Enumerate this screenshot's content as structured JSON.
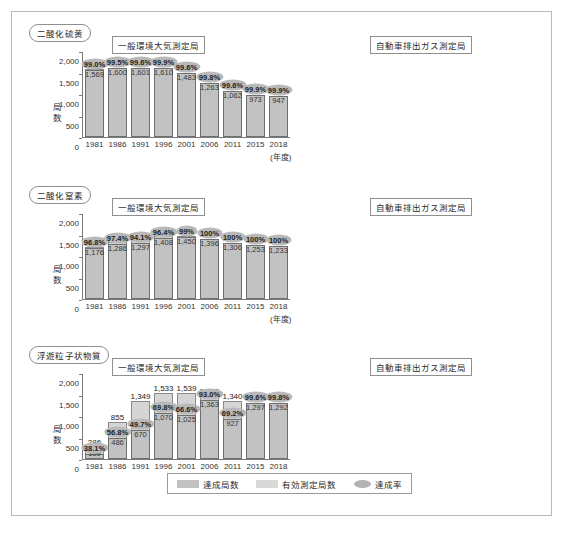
{
  "legend": {
    "achieved_label": "達成局数",
    "valid_label": "有効測定局数",
    "rate_label": "達成率"
  },
  "axis": {
    "ylabel": "局数",
    "nendo": "(年度)",
    "years": [
      "1981",
      "1986",
      "1991",
      "1996",
      "2001",
      "2006",
      "2011",
      "2015",
      "2018"
    ],
    "ticks_2000": [
      "2,000",
      "1,500",
      "1,000",
      "500",
      "0"
    ],
    "ticks_450": [
      "450",
      "300",
      "150",
      "0"
    ]
  },
  "panels": {
    "general": "一般環境大気測定局",
    "automobile": "自動車排出ガス測定局"
  },
  "pollutants": {
    "so2": "二酸化硫黄",
    "no2": "二酸化窒素",
    "spm": "浮遊粒子状物質"
  },
  "chart_data": [
    {
      "type": "bar",
      "title": "二酸化硫黄 — 一般環境大気測定局",
      "xlabel": "(年度)",
      "ylabel": "局数",
      "ylim": [
        0,
        2000
      ],
      "grid": false,
      "legend": "bottom",
      "categories": [
        "1981",
        "1986",
        "1991",
        "1996",
        "2001",
        "2006",
        "2011",
        "2015",
        "2018"
      ],
      "series": [
        {
          "name": "有効測定局数",
          "values": [
            1585,
            1608,
            1607,
            1612,
            1489,
            1265,
            1066,
            974,
            948
          ]
        },
        {
          "name": "達成局数",
          "values": [
            1569,
            1600,
            1601,
            1610,
            1483,
            1263,
            1062,
            973,
            947
          ]
        }
      ],
      "rates": [
        "99.0%",
        "99.5%",
        "99.6%",
        "99.9%",
        "99.6%",
        "99.8%",
        "99.6%",
        "99.9%",
        "99.9%"
      ]
    },
    {
      "type": "bar",
      "title": "二酸化硫黄 — 自動車排出ガス測定局",
      "xlabel": "(年度)",
      "ylabel": "局数",
      "ylim": [
        0,
        450
      ],
      "grid": false,
      "legend": "bottom",
      "categories": [
        "1981",
        "1986",
        "1991",
        "1996",
        "2001",
        "2006",
        "2011",
        "2015",
        "2018"
      ],
      "series": [
        {
          "name": "有効測定局数",
          "values": [
            42,
            49,
            70,
            101,
            95,
            86,
            61,
            51,
            49
          ]
        },
        {
          "name": "達成局数",
          "values": [
            40,
            48,
            69,
            101,
            95,
            86,
            61,
            51,
            49
          ]
        }
      ],
      "rates": [
        "95.2%",
        "98.0%",
        "98.6%",
        "100%",
        "100%",
        "100%",
        "100%",
        "100%",
        "100%"
      ]
    },
    {
      "type": "bar",
      "title": "二酸化窒素 — 一般環境大気測定局",
      "xlabel": "(年度)",
      "ylabel": "局数",
      "ylim": [
        0,
        2000
      ],
      "grid": false,
      "legend": "bottom",
      "categories": [
        "1981",
        "1986",
        "1991",
        "1996",
        "2001",
        "2006",
        "2011",
        "2015",
        "2018"
      ],
      "series": [
        {
          "name": "有効測定局数",
          "values": [
            1215,
            1321,
            1378,
            1460,
            1465,
            1397,
            1308,
            1253,
            1233
          ]
        },
        {
          "name": "達成局数",
          "values": [
            1176,
            1286,
            1297,
            1408,
            1450,
            1396,
            1306,
            1253,
            1233
          ]
        }
      ],
      "rates": [
        "96.8%",
        "97.4%",
        "94.1%",
        "96.4%",
        "99%",
        "100%",
        "100%",
        "100%",
        "100%"
      ]
    },
    {
      "type": "bar",
      "title": "二酸化窒素 — 自動車排出ガス測定局",
      "xlabel": "(年度)",
      "ylabel": "局数",
      "ylim": [
        0,
        450
      ],
      "grid": false,
      "legend": "bottom",
      "categories": [
        "1981",
        "1986",
        "1991",
        "1996",
        "2001",
        "2006",
        "2011",
        "2015",
        "2018"
      ],
      "series": [
        {
          "name": "有効測定局数",
          "values": [
            249,
            282,
            325,
            373,
            399,
            441,
            411,
            402,
            391
          ]
        },
        {
          "name": "達成局数",
          "values": [
            164,
            212,
            204,
            241,
            317,
            400,
            409,
            401,
            390
          ]
        }
      ],
      "rates": [
        "65.9%",
        "75.2%",
        "62.8%",
        "64.6%",
        "79.4%",
        "90.7%",
        "99.5%",
        "99.8%",
        "99.7%"
      ]
    },
    {
      "type": "bar",
      "title": "浮遊粒子状物質 — 一般環境大気測定局",
      "xlabel": "(年度)",
      "ylabel": "局数",
      "ylim": [
        0,
        2000
      ],
      "grid": false,
      "legend": "bottom",
      "categories": [
        "1981",
        "1986",
        "1991",
        "1996",
        "2001",
        "2006",
        "2011",
        "2015",
        "2018"
      ],
      "series": [
        {
          "name": "有効測定局数",
          "values": [
            286,
            855,
            1349,
            1533,
            1539,
            1465,
            1340,
            1302,
            1294
          ]
        },
        {
          "name": "達成局数",
          "values": [
            109,
            486,
            670,
            1070,
            1025,
            1363,
            927,
            1297,
            1292
          ]
        }
      ],
      "rates": [
        "38.1%",
        "56.8%",
        "49.7%",
        "69.8%",
        "66.6%",
        "93.0%",
        "69.2%",
        "99.6%",
        "99.8%"
      ]
    },
    {
      "type": "bar",
      "title": "浮遊粒子状物質 — 自動車排出ガス測定局",
      "xlabel": "(年度)",
      "ylabel": "局数",
      "ylim": [
        0,
        450
      ],
      "grid": false,
      "legend": "bottom",
      "categories": [
        "1981",
        "1986",
        "1991",
        "1996",
        "2001",
        "2006",
        "2011",
        "2015",
        "2018"
      ],
      "series": [
        {
          "name": "有効測定局数",
          "values": [
            21,
            74,
            166,
            229,
            319,
            418,
            395,
            391,
            384
          ]
        },
        {
          "name": "達成局数",
          "values": [
            0,
            21,
            50,
            97,
            150,
            388,
            288,
            390,
            384
          ]
        }
      ],
      "rates": [
        "0.0%",
        "28.4%",
        "30.1%",
        "42.4%",
        "47.0%",
        "92.8%",
        "72.9%",
        "99.7%",
        "100%"
      ]
    }
  ]
}
